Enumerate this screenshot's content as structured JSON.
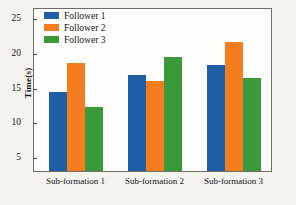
{
  "chart_data": {
    "type": "bar",
    "title": "",
    "xlabel": "",
    "ylabel": "Time(s)",
    "categories": [
      "Sub-formation 1",
      "Sub-formation 2",
      "Sub-formation 3"
    ],
    "series": [
      {
        "name": "Follower 1",
        "color": "#1f5fa8",
        "values": [
          14.5,
          17.0,
          18.4
        ]
      },
      {
        "name": "Follower 2",
        "color": "#f57d20",
        "values": [
          18.7,
          16.1,
          21.8
        ]
      },
      {
        "name": "Follower 3",
        "color": "#3a9a3a",
        "values": [
          12.3,
          19.6,
          16.6
        ]
      }
    ],
    "ylim": [
      3.1,
      26.5
    ],
    "yticks": [
      5,
      10,
      15,
      20,
      25
    ],
    "ytick_labels": [
      "5",
      "10",
      "15",
      "20",
      "25"
    ],
    "grid": false,
    "legend_position": "upper left"
  },
  "colors": {
    "follower1": "#1f5fa8",
    "follower2": "#f57d20",
    "follower3": "#3a9a3a",
    "frame": "#6e6e66",
    "background": "#f4f3ee",
    "plot_background": "#fdfdfb"
  }
}
